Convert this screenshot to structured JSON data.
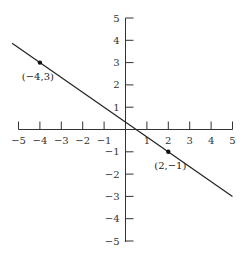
{
  "chart_data": {
    "type": "line",
    "title": "",
    "xlabel": "",
    "ylabel": "",
    "xlim": [
      -5,
      5
    ],
    "ylim": [
      -5,
      5
    ],
    "grid": false,
    "x_ticks": [
      -5,
      -4,
      -3,
      -2,
      -1,
      1,
      2,
      3,
      4,
      5
    ],
    "y_ticks": [
      -5,
      -4,
      -3,
      -2,
      -1,
      1,
      2,
      3,
      4,
      5
    ],
    "x_tick_labels": [
      "−5",
      "−4",
      "−3",
      "−2",
      "−1",
      "1",
      "2",
      "3",
      "4",
      "5"
    ],
    "y_tick_labels": [
      "−5",
      "−4",
      "−3",
      "−2",
      "−1",
      "1",
      "2",
      "3",
      "4",
      "5"
    ],
    "series": [
      {
        "name": "line",
        "equation": "y = -2/3 x + 1/3",
        "x": [
          -5.3,
          5
        ],
        "y": [
          3.867,
          -3
        ]
      }
    ],
    "points": [
      {
        "x": -4,
        "y": 3,
        "label": "(−4,3)"
      },
      {
        "x": 2,
        "y": -1,
        "label": "(2,−1)"
      }
    ],
    "colors": {
      "axis": "#333333",
      "line": "#222222",
      "point": "#111111"
    }
  }
}
